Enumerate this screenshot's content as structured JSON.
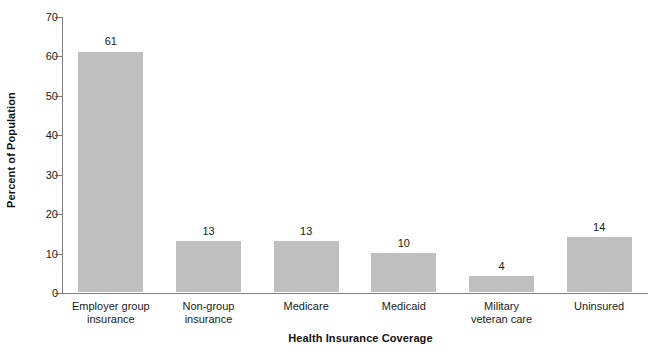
{
  "chart_data": {
    "type": "bar",
    "title": "",
    "xlabel": "Health Insurance Coverage",
    "ylabel": "Percent of Population",
    "categories": [
      "Employer group insurance",
      "Non-group insurance",
      "Medicare",
      "Medicaid",
      "Military veteran care",
      "Uninsured"
    ],
    "category_lines": [
      [
        "Employer group",
        "insurance"
      ],
      [
        "Non-group",
        "insurance"
      ],
      [
        "Medicare",
        ""
      ],
      [
        "Medicaid",
        ""
      ],
      [
        "Military",
        "veteran care"
      ],
      [
        "Uninsured",
        ""
      ]
    ],
    "values": [
      61,
      13,
      13,
      10,
      4,
      14
    ],
    "value_labels": [
      "61",
      "13",
      "13",
      "10",
      "4",
      "14"
    ],
    "ylim": [
      0,
      70
    ],
    "yticks": [
      0,
      10,
      20,
      30,
      40,
      50,
      60,
      70
    ],
    "ytick_labels": [
      "0",
      "10",
      "20",
      "30",
      "40",
      "50",
      "60",
      "70"
    ],
    "grid": false,
    "legend": "none",
    "bar_color": "#bfbfbf",
    "axis_color": "#808080",
    "text_color": "#1a1a1a"
  }
}
